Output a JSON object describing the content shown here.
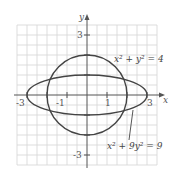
{
  "figure": {
    "x_axis_label": "x",
    "y_axis_label": "y",
    "x_ticks": [
      "-3",
      "-1",
      "1",
      "3"
    ],
    "y_ticks": [
      "3",
      "-3"
    ],
    "circle_equation": "x² + y² = 4",
    "ellipse_equation": "x² + 9y² = 9",
    "colors": {
      "curve": "#444444",
      "grid": "#cfcfcf",
      "axis": "#555555"
    }
  }
}
